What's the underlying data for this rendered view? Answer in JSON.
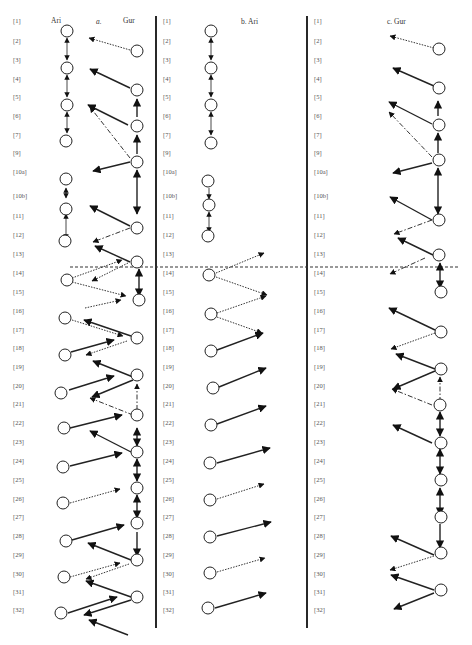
{
  "figure": {
    "panels": [
      {
        "id": "a",
        "title": "a.",
        "speaker_left": "Ari",
        "speaker_right": "Gur"
      },
      {
        "id": "b",
        "title": "b. Ari"
      },
      {
        "id": "c",
        "title": "c. Gur"
      }
    ],
    "line_labels": [
      "[1]",
      "[2]",
      "[3]",
      "[4]",
      "[5]",
      "[6]",
      "[7]",
      "[9]",
      "[10a]",
      "[10b]",
      "[11]",
      "[12]",
      "[13]",
      "[14]",
      "[15]",
      "[16]",
      "[17]",
      "[18]",
      "[19]",
      "[20]",
      "[21]",
      "[22]",
      "[23]",
      "[24]",
      "[25]",
      "[26]",
      "[27]",
      "[28]",
      "[29]",
      "[30]",
      "[31]",
      "[32]"
    ],
    "divider_line_label": "[14]",
    "edge_styles": {
      "solid": "solid arrow",
      "dotted": "dotted arrow",
      "dashdot": "dash-dot arrow",
      "vertical": "vertical double-headed arrow"
    }
  }
}
